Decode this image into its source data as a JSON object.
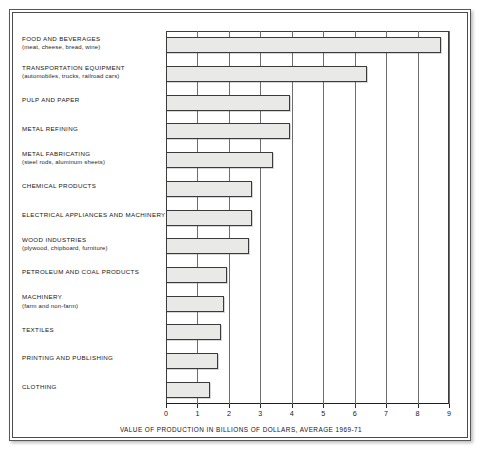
{
  "chart_data": {
    "type": "bar",
    "orientation": "horizontal",
    "title": "",
    "subtitle": "",
    "xlabel": "VALUE OF PRODUCTION IN BILLIONS OF DOLLARS, AVERAGE 1969-71",
    "ylabel": "",
    "xlim": [
      0,
      9
    ],
    "ylim": null,
    "grid": true,
    "legend": null,
    "xticks": [
      "0",
      "1",
      "2",
      "3",
      "4",
      "5",
      "6",
      "7",
      "8",
      "9"
    ],
    "xtick_values": [
      0,
      1,
      2,
      3,
      4,
      5,
      6,
      7,
      8,
      9
    ],
    "categories": [
      "FOOD AND BEVERAGES",
      "TRANSPORTATION EQUIPMENT",
      "PULP AND PAPER",
      "METAL REFINING",
      "METAL FABRICATING",
      "CHEMICAL PRODUCTS",
      "ELECTRICAL APPLIANCES AND MACHINERY",
      "WOOD INDUSTRIES",
      "PETROLEUM AND COAL PRODUCTS",
      "MACHINERY",
      "TEXTILES",
      "PRINTING AND PUBLISHING",
      "CLOTHING"
    ],
    "category_sublabels": [
      "(meat, cheese, bread, wine)",
      "(automobiles, trucks, railroad cars)",
      "",
      "",
      "(steel rods, aluminum sheets)",
      "",
      "",
      "(plywood, chipboard, furniture)",
      "",
      "(farm and non-farm)",
      "",
      "",
      ""
    ],
    "values": [
      8.75,
      6.4,
      3.95,
      3.95,
      3.4,
      2.75,
      2.75,
      2.65,
      1.95,
      1.85,
      1.75,
      1.65,
      1.4
    ],
    "bar_fill_color": "#e9e9e7",
    "bar_edge_color": "#3a3a3c",
    "axis_color": "#3d3d3f",
    "grid_color": "#6e6e70",
    "background_color": "#ffffff"
  },
  "caption": {
    "text": "VALUE OF PRODUCTION IN BILLIONS OF DOLLARS, AVERAGE 1969-71"
  }
}
